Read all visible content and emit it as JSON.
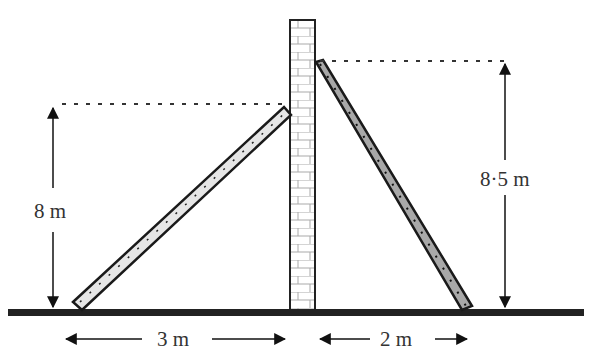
{
  "diagram": {
    "type": "ladders-against-wall",
    "labels": {
      "left_height": "8 m",
      "right_height": "8·5 m",
      "left_base": "3 m",
      "right_base": "2 m"
    },
    "colors": {
      "left_ladder_fill": "#e6e6e6",
      "right_ladder_fill": "#a8a8a8",
      "outline": "#1a1a1a",
      "ground": "#222222",
      "wall_fill": "#ffffff"
    },
    "elements": [
      "ground",
      "brick-wall",
      "left-ladder",
      "right-ladder",
      "height-arrows",
      "base-arrows"
    ]
  }
}
